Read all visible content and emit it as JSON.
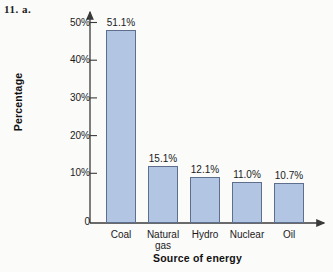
{
  "figure": {
    "problem_label": "11. a.",
    "background_color": "#fbfbfa"
  },
  "chart_data": {
    "type": "bar",
    "title": "",
    "xlabel": "Source of energy",
    "ylabel": "Percentage",
    "categories": [
      "Coal",
      "Natural\ngas",
      "Hydro",
      "Nuclear",
      "Oil"
    ],
    "values": [
      51.1,
      15.1,
      12.1,
      11.0,
      10.7
    ],
    "value_labels": [
      "51.1%",
      "15.1%",
      "12.1%",
      "11.0%",
      "10.7%"
    ],
    "ylim": [
      0,
      55
    ],
    "ytick_values": [
      0,
      10,
      20,
      30,
      40,
      50
    ],
    "ytick_labels": [
      "0",
      "10%",
      "20%",
      "30%",
      "40%",
      "50%"
    ],
    "grid": false,
    "legend": null,
    "bar_color": "#b2c5e3",
    "bar_border_color": "#5d6f8c",
    "axis_color": "#3a3a3a"
  },
  "geometry": {
    "baseline_y": 223,
    "px_per_percent": 3.77,
    "axis_x": 90,
    "bar_width": 30,
    "bar_pitch": 42,
    "first_bar_left": 106
  }
}
